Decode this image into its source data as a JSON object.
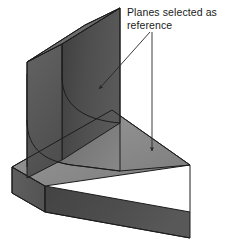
{
  "figure": {
    "background_color": "#ffffff",
    "annotation": {
      "label": "Planes selected as reference",
      "line1": "Planes selected as",
      "line2": "reference",
      "text_color": "#1a1a1a",
      "leader_color": "#262626"
    },
    "leaders": [
      {
        "name": "leader-to-vertical-wall-face",
        "from_x": 150,
        "from_y": 32,
        "to_x": 96,
        "to_y": 92,
        "target": "vertical wall front face"
      },
      {
        "name": "leader-to-base-top-face",
        "from_x": 152,
        "from_y": 32,
        "to_x": 152,
        "to_y": 155,
        "target": "base plate top face"
      }
    ],
    "solid": {
      "name": "l-bracket",
      "faces": [
        {
          "name": "wall-front-face",
          "color": "#4b4b4b",
          "selected": true
        },
        {
          "name": "wall-top-face",
          "color": "#6e6e6e",
          "selected": false
        },
        {
          "name": "wall-left-end-face",
          "color": "#595959",
          "selected": false
        },
        {
          "name": "base-top-face",
          "color": "#8c8c8c",
          "selected": true
        },
        {
          "name": "base-front-face",
          "color": "#4b4b4b",
          "selected": false
        },
        {
          "name": "base-left-face",
          "color": "#5e5e5e",
          "selected": false
        },
        {
          "name": "fillet-face",
          "color": "#6b6b6b",
          "selected": false
        }
      ],
      "edge_color": "#1c1c1c"
    }
  }
}
